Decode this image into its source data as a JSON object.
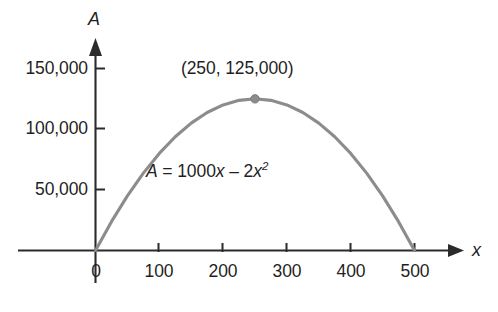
{
  "chart_data": {
    "type": "line",
    "title": "",
    "subtitle": "",
    "xlabel": "x",
    "ylabel": "A",
    "xlim": [
      -30,
      560
    ],
    "ylim": [
      -12000,
      160000
    ],
    "grid": false,
    "legend": "none",
    "equation_plain": "A = 1000x - 2x^2",
    "series": [
      {
        "name": "A = 1000x - 2x^2",
        "color": "#8c8c8c",
        "x": [
          0,
          25,
          50,
          75,
          100,
          125,
          150,
          175,
          200,
          225,
          250,
          275,
          300,
          325,
          350,
          375,
          400,
          425,
          450,
          475,
          500
        ],
        "values": [
          0,
          23750,
          45000,
          63750,
          80000,
          93750,
          105000,
          113750,
          120000,
          123750,
          125000,
          123750,
          120000,
          113750,
          105000,
          93750,
          80000,
          63750,
          45000,
          23750,
          0
        ]
      }
    ],
    "x_ticks": [
      0,
      100,
      200,
      300,
      400,
      500
    ],
    "x_tick_labels": [
      "0",
      "100",
      "200",
      "300",
      "400",
      "500"
    ],
    "y_ticks": [
      50000,
      100000,
      150000
    ],
    "y_tick_labels": [
      "50,000",
      "100,000",
      "150,000"
    ],
    "annotations": [
      {
        "name": "vertex-label",
        "text": "(250, 125,000)",
        "x": 250,
        "y": 125000
      },
      {
        "name": "equation-label",
        "text": "A = 1000x – 2x2",
        "parts": {
          "a": "A",
          "equals": "=",
          "term1": "1000",
          "var1": "x",
          "minus": "–",
          "coef2": "2",
          "var2": "x",
          "exp2": "2"
        }
      }
    ],
    "markers": [
      {
        "name": "vertex-point",
        "x": 250,
        "y": 125000,
        "color": "#8c8c8c"
      }
    ],
    "axis_colors": {
      "axis": "#2b2b2b",
      "curve": "#8c8c8c",
      "text": "#1f1f1f",
      "background": "#ffffff"
    }
  }
}
